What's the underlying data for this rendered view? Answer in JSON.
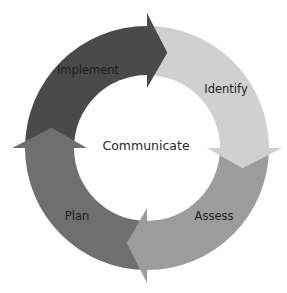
{
  "diagram": {
    "type": "cycle",
    "center_label": "Communicate",
    "stages": [
      {
        "id": "implement",
        "label": "Implement",
        "color": "#4a4a4a"
      },
      {
        "id": "identify",
        "label": "Identify",
        "color": "#d0d0d0"
      },
      {
        "id": "assess",
        "label": "Assess",
        "color": "#9c9c9c"
      },
      {
        "id": "plan",
        "label": "Plan",
        "color": "#6f6f6f"
      }
    ],
    "direction": "clockwise",
    "background": "#ffffff"
  }
}
